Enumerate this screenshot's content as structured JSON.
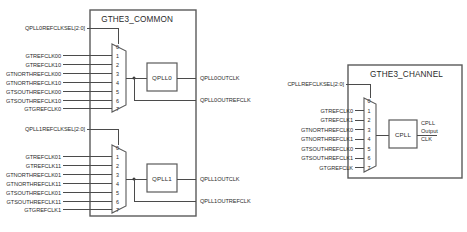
{
  "diagram": {
    "colors": {
      "wire": "#4b4b4b",
      "box_border": "#5a5a5a",
      "text": "#2b2b2b",
      "background": "#ffffff"
    },
    "blocks": [
      {
        "id": "gthe3_common",
        "title": "GTHE3_COMMON",
        "muxes": [
          {
            "id": "qpll0_mux",
            "select_label": "QPLL0REFCLKSEL[2:0]",
            "port_numbers": [
              "0",
              "1",
              "2",
              "3",
              "4",
              "5",
              "6",
              "7"
            ],
            "inputs": [
              "",
              "GTREFCLK00",
              "GTREFCLK10",
              "GTNORTHREFCLK00",
              "GTNORTHREFCLK10",
              "GTSOUTHREFCLK00",
              "GTSOUTHREFCLK10",
              "GTGREFCLK0"
            ],
            "pll_name": "QPLL0",
            "outputs": [
              "QPLL0OUTCLK",
              "QPLL0OUTREFCLK"
            ]
          },
          {
            "id": "qpll1_mux",
            "select_label": "QPLL1REFCLKSEL[2:0]",
            "port_numbers": [
              "0",
              "1",
              "2",
              "3",
              "4",
              "5",
              "6",
              "7"
            ],
            "inputs": [
              "",
              "GTREFCLK01",
              "GTREFCLK11",
              "GTNORTHREFCLK01",
              "GTNORTHREFCLK11",
              "GTSOUTHREFCLK01",
              "GTSOUTHREFCLK11",
              "GTGREFCLK1"
            ],
            "pll_name": "QPLL1",
            "outputs": [
              "QPLL1OUTCLK",
              "QPLL1OUTREFCLK"
            ]
          }
        ]
      },
      {
        "id": "gthe3_channel",
        "title": "GTHE3_CHANNEL",
        "muxes": [
          {
            "id": "cpll_mux",
            "select_label": "CPLLREFCLKSEL[2:0]",
            "port_numbers": [
              "0",
              "1",
              "2",
              "3",
              "4",
              "5",
              "6",
              "7"
            ],
            "inputs": [
              "",
              "GTREFCLK0",
              "GTREFCLK1",
              "GTNORTHREFCLK0",
              "GTNORTHREFCLK1",
              "GTSOUTHREFCLK0",
              "GTSOUTHREFCLK1",
              "GTGREFCLK"
            ],
            "pll_name": "CPLL",
            "output_lines": [
              "CPLL",
              "Output",
              "CLK"
            ]
          }
        ]
      }
    ]
  }
}
